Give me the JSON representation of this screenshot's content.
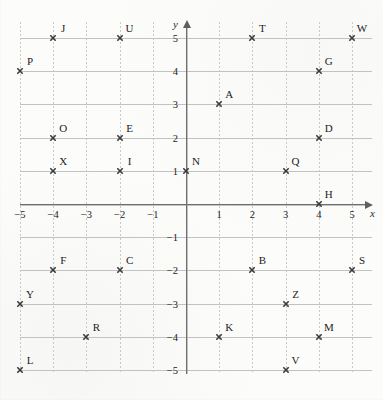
{
  "chart_data": {
    "type": "scatter",
    "title": "",
    "xlabel": "x",
    "ylabel": "y",
    "xlim": [
      -5.5,
      5.5
    ],
    "ylim": [
      -5.5,
      5.5
    ],
    "grid": true,
    "legend": "none",
    "x_ticks": [
      "−5",
      "−4",
      "−3",
      "−2",
      "−1",
      "1",
      "2",
      "3",
      "4",
      "5"
    ],
    "x_tick_values": [
      -5,
      -4,
      -3,
      -2,
      -1,
      1,
      2,
      3,
      4,
      5
    ],
    "y_ticks": [
      "5",
      "4",
      "3",
      "2",
      "1",
      "−1",
      "−2",
      "−3",
      "−4",
      "−5"
    ],
    "y_tick_values": [
      5,
      4,
      3,
      2,
      1,
      -1,
      -2,
      -3,
      -4,
      -5
    ],
    "points": [
      {
        "label": "J",
        "x": -4,
        "y": 5
      },
      {
        "label": "U",
        "x": -2,
        "y": 5
      },
      {
        "label": "T",
        "x": 2,
        "y": 5
      },
      {
        "label": "W",
        "x": 5,
        "y": 5
      },
      {
        "label": "P",
        "x": -5,
        "y": 4
      },
      {
        "label": "G",
        "x": 4,
        "y": 4
      },
      {
        "label": "A",
        "x": 1,
        "y": 3
      },
      {
        "label": "O",
        "x": -4,
        "y": 2
      },
      {
        "label": "E",
        "x": -2,
        "y": 2
      },
      {
        "label": "D",
        "x": 4,
        "y": 2
      },
      {
        "label": "X",
        "x": -4,
        "y": 1
      },
      {
        "label": "I",
        "x": -2,
        "y": 1
      },
      {
        "label": "N",
        "x": 0,
        "y": 1
      },
      {
        "label": "Q",
        "x": 3,
        "y": 1
      },
      {
        "label": "H",
        "x": 4,
        "y": 0
      },
      {
        "label": "F",
        "x": -4,
        "y": -2
      },
      {
        "label": "C",
        "x": -2,
        "y": -2
      },
      {
        "label": "B",
        "x": 2,
        "y": -2
      },
      {
        "label": "S",
        "x": 5,
        "y": -2
      },
      {
        "label": "Y",
        "x": -5,
        "y": -3
      },
      {
        "label": "Z",
        "x": 3,
        "y": -3
      },
      {
        "label": "R",
        "x": -3,
        "y": -4
      },
      {
        "label": "K",
        "x": 1,
        "y": -4
      },
      {
        "label": "M",
        "x": 4,
        "y": -4
      },
      {
        "label": "L",
        "x": -5,
        "y": -5
      },
      {
        "label": "V",
        "x": 3,
        "y": -5
      }
    ],
    "colors": {
      "marker": "#3a3a3a",
      "axis": "#6e6e6e",
      "gridline_horizontal": "#c2c2c2",
      "gridline_vertical": "#c9c9c9",
      "background": "#fcfcfb",
      "label_text": "#1c1c1c"
    }
  },
  "geometry": {
    "origin_x": 186,
    "origin_y": 204,
    "unit": 33.2
  }
}
